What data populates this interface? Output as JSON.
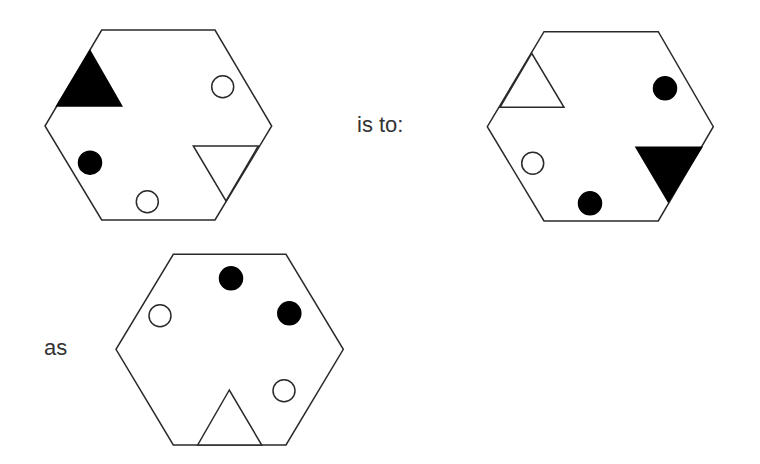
{
  "labels": {
    "is_to": "is to:",
    "as": "as"
  },
  "colors": {
    "stroke": "#2a2a2a",
    "fill_black": "#000000",
    "fill_white": "#ffffff",
    "text": "#333333"
  },
  "figures": [
    {
      "id": "figure-a",
      "hexagon": "101.7,30 215,30 271.7,126 215,220 101.7,220 45,126",
      "triangles": [
        {
          "points": "90,50.7 56.7,106 121.7,106",
          "filled": true
        },
        {
          "points": "193.3,146 258.3,146 226,201",
          "filled": false
        }
      ],
      "circles": [
        {
          "cx": 222.7,
          "cy": 86.7,
          "r": 11,
          "filled": false
        },
        {
          "cx": 90,
          "cy": 162.7,
          "r": 11.5,
          "filled": true
        },
        {
          "cx": 147.3,
          "cy": 201.7,
          "r": 11,
          "filled": false
        }
      ]
    },
    {
      "id": "figure-b",
      "hexagon": "544,31.7 658.3,31.7 713.3,126.7 658.3,221 544,221 487.3,126.7",
      "triangles": [
        {
          "points": "531.7,53.3 500,107.3 564,107.3",
          "filled": false
        },
        {
          "points": "636,147.3 701.7,147.3 668.3,201.7",
          "filled": true
        }
      ],
      "circles": [
        {
          "cx": 665,
          "cy": 88.3,
          "r": 11.5,
          "filled": true
        },
        {
          "cx": 532.7,
          "cy": 163.3,
          "r": 11,
          "filled": false
        },
        {
          "cx": 590,
          "cy": 203.3,
          "r": 11.5,
          "filled": true
        }
      ]
    },
    {
      "id": "figure-c",
      "hexagon": "173.3,254.3 286,254.3 343.3,349.3 286,445 173.3,445 116,349.3",
      "triangles": [
        {
          "points": "229.3,390 197.7,445 261.7,445",
          "filled": false
        }
      ],
      "circles": [
        {
          "cx": 231,
          "cy": 278.3,
          "r": 11.5,
          "filled": true
        },
        {
          "cx": 289.3,
          "cy": 313.3,
          "r": 11.5,
          "filled": true
        },
        {
          "cx": 160,
          "cy": 315.7,
          "r": 11,
          "filled": false
        },
        {
          "cx": 284,
          "cy": 390.7,
          "r": 11,
          "filled": false
        }
      ]
    }
  ]
}
